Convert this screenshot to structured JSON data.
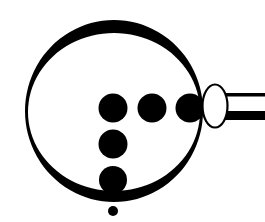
{
  "diagram": {
    "colors": {
      "ink": "#000000",
      "background": "#ffffff"
    },
    "lens": {
      "cx": 114,
      "cy": 112,
      "rx": 88,
      "ry": 89
    },
    "dots": [
      {
        "cx": 113,
        "cy": 108,
        "r": 14.5
      },
      {
        "cx": 152,
        "cy": 108,
        "r": 14.5
      },
      {
        "cx": 191,
        "cy": 108,
        "r": 14.5
      },
      {
        "cx": 113,
        "cy": 144,
        "r": 14.5
      },
      {
        "cx": 113,
        "cy": 181,
        "r": 14.5
      }
    ],
    "small_dot": {
      "cx": 113,
      "cy": 211,
      "r": 5
    },
    "ferrule": {
      "cx": 215,
      "cy": 106,
      "rx": 13,
      "ry": 22
    },
    "handle": {
      "x": 228,
      "top_line_y": 93,
      "bottom_band_y": 111,
      "end_x": 265
    }
  }
}
